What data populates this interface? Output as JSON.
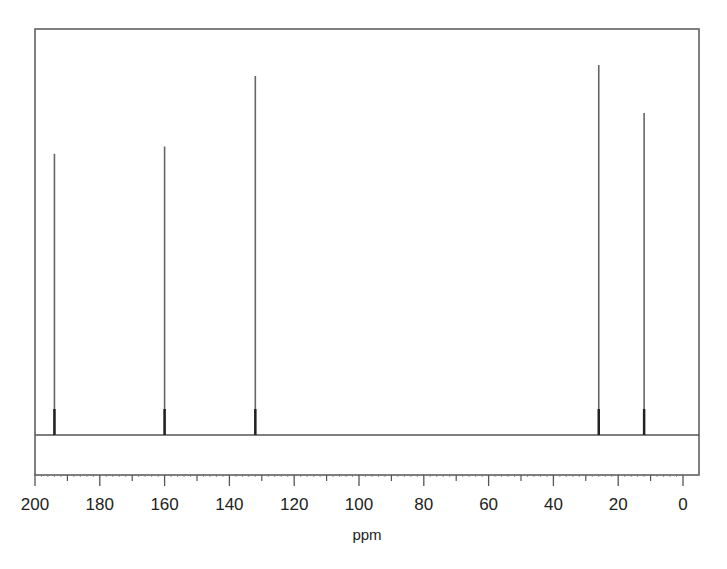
{
  "chart_data": {
    "type": "spectrum",
    "title": "",
    "xlabel": "ppm",
    "ylabel": "",
    "xlim": [
      200,
      0
    ],
    "x_reversed": true,
    "x_ticks_major": [
      200,
      180,
      160,
      140,
      120,
      100,
      80,
      60,
      40,
      20,
      0
    ],
    "x_ticks_minor": [
      190,
      170,
      150,
      130,
      110,
      90,
      70,
      50,
      30,
      10
    ],
    "grid": false,
    "legend": null,
    "peaks": [
      {
        "ppm": 194,
        "relative_height": 76
      },
      {
        "ppm": 160,
        "relative_height": 78
      },
      {
        "ppm": 132,
        "relative_height": 97
      },
      {
        "ppm": 26,
        "relative_height": 100
      },
      {
        "ppm": 12,
        "relative_height": 87
      }
    ]
  },
  "axis": {
    "xlabel": "ppm",
    "tick_labels": [
      "200",
      "180",
      "160",
      "140",
      "120",
      "100",
      "80",
      "60",
      "40",
      "20",
      "0"
    ]
  }
}
